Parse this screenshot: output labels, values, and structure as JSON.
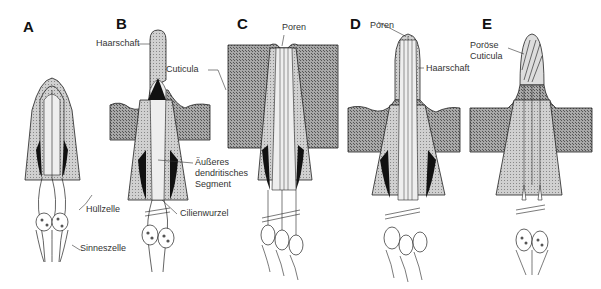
{
  "figure": {
    "panels": [
      {
        "letter": "A"
      },
      {
        "letter": "B"
      },
      {
        "letter": "C"
      },
      {
        "letter": "D"
      },
      {
        "letter": "E"
      }
    ],
    "labels": {
      "haarschaft_b": "Haarschaft",
      "cuticula": "Cuticula",
      "aeusseres_line1": "Äußeres",
      "aeusseres_line2": "dendritisches",
      "aeusseres_line3": "Segment",
      "cilienwurzel": "Cilienwurzel",
      "huellzelle": "Hüllzelle",
      "sinneszelle": "Sinneszelle",
      "poren_c": "Poren",
      "poren_d": "Poren",
      "haarschaft_d": "Haarschaft",
      "poroese_line1": "Poröse",
      "poroese_line2": "Cuticula"
    },
    "colors": {
      "cuticle_fill": "#9a9a9a",
      "sheath_fill": "#bdbdbd",
      "line": "#222222",
      "dark": "#111111"
    }
  }
}
